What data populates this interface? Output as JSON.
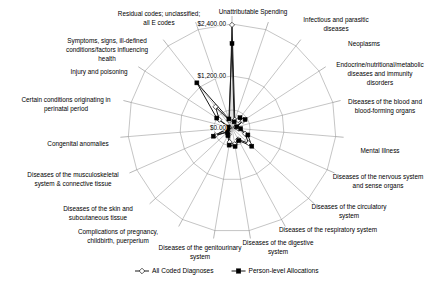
{
  "chart_data": {
    "type": "radar",
    "title": "",
    "subtitle": "",
    "xlabel": "",
    "ylabel": "",
    "grid": true,
    "legend_position": "bottom",
    "rlim": [
      0,
      2400
    ],
    "r_ticks": [
      0,
      1200,
      2400
    ],
    "r_tick_labels": [
      "$0.00",
      "$1,200.00",
      "$2,400.00"
    ],
    "categories": [
      "Unattributable Spending",
      "Infectious and parasitic diseases",
      "Neoplasms",
      "Endocrine/nutritional/metabolic diseases and immunity disorders",
      "Diseases of the blood and blood-forming organs",
      "Mental Illness",
      "Diseases of the nervous system and sense organs",
      "Diseases of the circulatory system",
      "Diseases of the respiratory system",
      "Diseases of the digestive system",
      "Diseases of the genitourinary system",
      "Complications of pregnancy, childbirth, puerperium",
      "Diseases of the skin and subcutaneous tissue",
      "Diseases of the musculoskeletal system & connective tissue",
      "Congenital anomalies",
      "Certain conditions originating in perinatal period",
      "Injury and poisoning",
      "Symptoms, signs, ill-defined conditions/factors influencing health",
      "Residual codes; unclassified; all E codes"
    ],
    "series": [
      {
        "name": "All Coded Diagnoses",
        "marker": "open-diamond",
        "values": [
          2380,
          200,
          230,
          300,
          90,
          150,
          330,
          520,
          300,
          380,
          330,
          170,
          120,
          420,
          80,
          70,
          350,
          620,
          180
        ]
      },
      {
        "name": "Person-level Allocations",
        "marker": "filled-square",
        "values": [
          1950,
          150,
          300,
          360,
          110,
          200,
          400,
          620,
          330,
          430,
          400,
          200,
          140,
          470,
          100,
          90,
          420,
          1320,
          220
        ]
      }
    ]
  },
  "legend": {
    "items": [
      {
        "label": "All Coded Diagnoses",
        "marker": "open-diamond"
      },
      {
        "label": "Person-level Allocations",
        "marker": "filled-square"
      }
    ]
  },
  "geometry": {
    "center_x": 232,
    "center_y": 128,
    "outer_radius": 104,
    "inner_radius": 18
  },
  "label_layout": [
    {
      "text": "Unattributable Spending",
      "x": 253,
      "y": 14,
      "anchor": "middle",
      "lines": 1
    },
    {
      "text": "Infectious and parasitic",
      "x": 336,
      "y": 22,
      "anchor": "middle",
      "lines": 2
    },
    {
      "text": "diseases",
      "x": 336,
      "y": 31,
      "anchor": "middle",
      "lines": 0
    },
    {
      "text": "Neoplasms",
      "x": 364,
      "y": 46,
      "anchor": "middle",
      "lines": 1
    },
    {
      "text": "Endocrine/nutritional/metabolic",
      "x": 380,
      "y": 67,
      "anchor": "middle",
      "lines": 3
    },
    {
      "text": "diseases and immunity",
      "x": 380,
      "y": 76,
      "anchor": "middle",
      "lines": 0
    },
    {
      "text": "disorders",
      "x": 380,
      "y": 85,
      "anchor": "middle",
      "lines": 0
    },
    {
      "text": "Diseases of the blood and",
      "x": 385,
      "y": 104,
      "anchor": "middle",
      "lines": 2
    },
    {
      "text": "blood-forming organs",
      "x": 385,
      "y": 113,
      "anchor": "middle",
      "lines": 0
    },
    {
      "text": "Mental Illness",
      "x": 380,
      "y": 153,
      "anchor": "middle",
      "lines": 1
    },
    {
      "text": "Diseases of the nervous system",
      "x": 378,
      "y": 179,
      "anchor": "middle",
      "lines": 2
    },
    {
      "text": "and sense organs",
      "x": 378,
      "y": 188,
      "anchor": "middle",
      "lines": 0
    },
    {
      "text": "Diseases of the circulatory",
      "x": 349,
      "y": 209,
      "anchor": "middle",
      "lines": 2
    },
    {
      "text": "system",
      "x": 349,
      "y": 218,
      "anchor": "middle",
      "lines": 0
    },
    {
      "text": "Diseases of the respiratory system",
      "x": 328,
      "y": 232,
      "anchor": "middle",
      "lines": 1
    },
    {
      "text": "Diseases of the digestive",
      "x": 278,
      "y": 245,
      "anchor": "middle",
      "lines": 2
    },
    {
      "text": "system",
      "x": 278,
      "y": 254,
      "anchor": "middle",
      "lines": 0
    },
    {
      "text": "Diseases of the genitourinary",
      "x": 200,
      "y": 250,
      "anchor": "middle",
      "lines": 2
    },
    {
      "text": "system",
      "x": 200,
      "y": 259,
      "anchor": "middle",
      "lines": 0
    },
    {
      "text": "Complications of pregnancy,",
      "x": 118,
      "y": 234,
      "anchor": "middle",
      "lines": 2
    },
    {
      "text": "childbirth, puerperium",
      "x": 118,
      "y": 243,
      "anchor": "middle",
      "lines": 0
    },
    {
      "text": "Diseases of the skin and",
      "x": 98,
      "y": 211,
      "anchor": "middle",
      "lines": 2
    },
    {
      "text": "subcutaneous tissue",
      "x": 98,
      "y": 220,
      "anchor": "middle",
      "lines": 0
    },
    {
      "text": "Diseases of the musculoskeletal",
      "x": 73,
      "y": 177,
      "anchor": "middle",
      "lines": 2
    },
    {
      "text": "system & connective tissue",
      "x": 73,
      "y": 186,
      "anchor": "middle",
      "lines": 0
    },
    {
      "text": "Congenital anomalies",
      "x": 78,
      "y": 146,
      "anchor": "middle",
      "lines": 1
    },
    {
      "text": "Certain conditions originating in",
      "x": 66,
      "y": 102,
      "anchor": "middle",
      "lines": 2
    },
    {
      "text": "perinatal period",
      "x": 66,
      "y": 111,
      "anchor": "middle",
      "lines": 0
    },
    {
      "text": "Injury and poisoning",
      "x": 99,
      "y": 74,
      "anchor": "middle",
      "lines": 1
    },
    {
      "text": "Symptoms, signs, ill-defined",
      "x": 107,
      "y": 43,
      "anchor": "middle",
      "lines": 3
    },
    {
      "text": "conditions/factors influencing",
      "x": 107,
      "y": 52,
      "anchor": "middle",
      "lines": 0
    },
    {
      "text": "health",
      "x": 107,
      "y": 61,
      "anchor": "middle",
      "lines": 0
    },
    {
      "text": "Residual codes; unclassified;",
      "x": 159,
      "y": 16,
      "anchor": "middle",
      "lines": 2
    },
    {
      "text": "all E codes",
      "x": 159,
      "y": 25,
      "anchor": "middle",
      "lines": 0
    }
  ]
}
